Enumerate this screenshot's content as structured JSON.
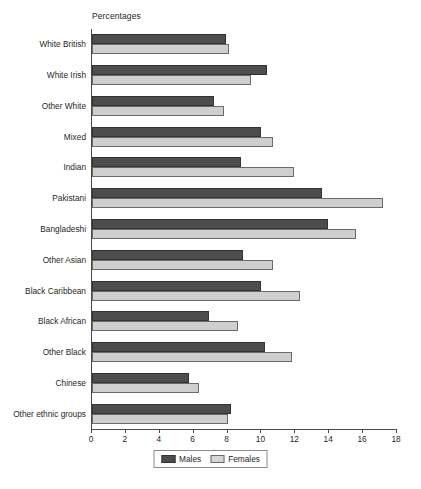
{
  "chart_data": {
    "type": "bar",
    "orientation": "horizontal",
    "title": "Percentages",
    "xlabel": "",
    "ylabel": "",
    "xlim": [
      0,
      18
    ],
    "xticks": [
      0,
      2,
      4,
      6,
      8,
      10,
      12,
      14,
      16,
      18
    ],
    "grid": false,
    "legend_position": "bottom-center",
    "categories": [
      "White British",
      "White Irish",
      "Other White",
      "Mixed",
      "Indian",
      "Pakistani",
      "Bangladeshi",
      "Other Asian",
      "Black Caribbean",
      "Black African",
      "Other Black",
      "Chinese",
      "Other ethnic groups"
    ],
    "series": [
      {
        "name": "Males",
        "color": "#4d4d4d",
        "values": [
          7.9,
          10.3,
          7.2,
          10.0,
          8.8,
          13.6,
          13.9,
          8.9,
          10.0,
          6.9,
          10.2,
          5.7,
          8.2
        ]
      },
      {
        "name": "Females",
        "color": "#cfcfcf",
        "values": [
          8.1,
          9.4,
          7.8,
          10.7,
          11.9,
          17.2,
          15.6,
          10.7,
          12.3,
          8.6,
          11.8,
          6.3,
          8.0
        ]
      }
    ]
  }
}
